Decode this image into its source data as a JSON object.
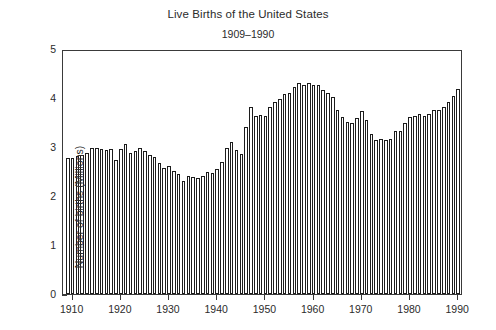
{
  "chart_data": {
    "type": "bar",
    "title": "Live Births of the United States",
    "subtitle": "1909–1990",
    "xlabel": "",
    "ylabel": "Number of births (Millions)",
    "ylim": [
      0,
      5
    ],
    "xlim": [
      1908,
      1991
    ],
    "grid": false,
    "legend": null,
    "y_ticks": [
      "0",
      "1",
      "2",
      "3",
      "4",
      "5"
    ],
    "y_tick_values": [
      0,
      1,
      2,
      3,
      4,
      5
    ],
    "x_ticks": [
      "1910",
      "1920",
      "1930",
      "1940",
      "1950",
      "1960",
      "1970",
      "1980",
      "1990"
    ],
    "x_tick_values": [
      1910,
      1920,
      1930,
      1940,
      1950,
      1960,
      1970,
      1980,
      1990
    ],
    "categories": [
      1909,
      1910,
      1911,
      1912,
      1913,
      1914,
      1915,
      1916,
      1917,
      1918,
      1919,
      1920,
      1921,
      1922,
      1923,
      1924,
      1925,
      1926,
      1927,
      1928,
      1929,
      1930,
      1931,
      1932,
      1933,
      1934,
      1935,
      1936,
      1937,
      1938,
      1939,
      1940,
      1941,
      1942,
      1943,
      1944,
      1945,
      1946,
      1947,
      1948,
      1949,
      1950,
      1951,
      1952,
      1953,
      1954,
      1955,
      1956,
      1957,
      1958,
      1959,
      1960,
      1961,
      1962,
      1963,
      1964,
      1965,
      1966,
      1967,
      1968,
      1969,
      1970,
      1971,
      1972,
      1973,
      1974,
      1975,
      1976,
      1977,
      1978,
      1979,
      1980,
      1981,
      1982,
      1983,
      1984,
      1985,
      1986,
      1987,
      1988,
      1989,
      1990
    ],
    "values": [
      2.78,
      2.78,
      2.81,
      2.84,
      2.87,
      2.97,
      2.97,
      2.96,
      2.94,
      2.95,
      2.74,
      2.95,
      3.06,
      2.88,
      2.91,
      2.98,
      2.91,
      2.84,
      2.8,
      2.67,
      2.58,
      2.62,
      2.51,
      2.44,
      2.31,
      2.4,
      2.38,
      2.36,
      2.41,
      2.5,
      2.47,
      2.56,
      2.7,
      2.99,
      3.1,
      2.94,
      2.86,
      3.41,
      3.82,
      3.64,
      3.65,
      3.63,
      3.82,
      3.91,
      3.97,
      4.08,
      4.1,
      4.22,
      4.31,
      4.26,
      4.3,
      4.26,
      4.27,
      4.17,
      4.1,
      4.03,
      3.76,
      3.61,
      3.52,
      3.5,
      3.6,
      3.73,
      3.56,
      3.26,
      3.14,
      3.16,
      3.14,
      3.17,
      3.33,
      3.33,
      3.49,
      3.61,
      3.63,
      3.68,
      3.64,
      3.67,
      3.76,
      3.76,
      3.81,
      3.91,
      4.04,
      4.18
    ]
  }
}
